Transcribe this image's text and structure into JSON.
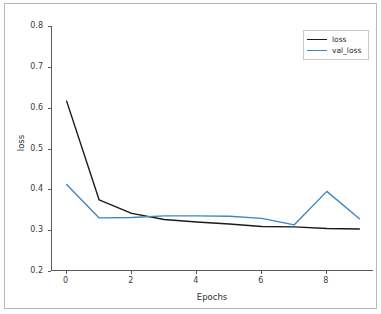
{
  "chart_data": {
    "type": "line",
    "title": "",
    "xlabel": "Epochs",
    "ylabel": "loss",
    "x": [
      0,
      1,
      2,
      3,
      4,
      5,
      6,
      7,
      8,
      9
    ],
    "xlim": [
      -0.45,
      9.45
    ],
    "ylim": [
      0.2,
      0.8
    ],
    "xticks": [
      0,
      2,
      4,
      6,
      8
    ],
    "xtick_labels": [
      "0",
      "2",
      "4",
      "6",
      "8"
    ],
    "yticks": [
      0.2,
      0.3,
      0.4,
      0.5,
      0.6,
      0.7,
      0.8
    ],
    "ytick_labels": [
      "0.2",
      "0.3",
      "0.4",
      "0.5",
      "0.6",
      "0.7",
      "0.8"
    ],
    "grid": false,
    "legend_position": "upper right",
    "series": [
      {
        "name": "loss",
        "color": "#1a1a1a",
        "values": [
          0.616,
          0.374,
          0.341,
          0.326,
          0.32,
          0.315,
          0.309,
          0.308,
          0.304,
          0.303
        ]
      },
      {
        "name": "val_loss",
        "color": "#3b86c8",
        "values": [
          0.412,
          0.33,
          0.331,
          0.335,
          0.335,
          0.334,
          0.329,
          0.313,
          0.395,
          0.328
        ]
      }
    ]
  },
  "legend": {
    "entries": [
      {
        "label": "loss"
      },
      {
        "label": "val_loss"
      }
    ]
  },
  "axes": {
    "x_title": "Epochs",
    "y_title": "loss"
  }
}
